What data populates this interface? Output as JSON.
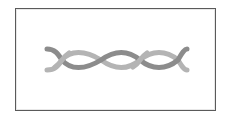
{
  "image": {
    "description": "Twisted rope / double helix icon inside a bordered frame",
    "icon": "twisted-rope-icon"
  },
  "colors": {
    "frame_border": "#5a5a5a",
    "background": "#ffffff",
    "strand_dark": "#8c8c8c",
    "strand_light": "#b4b4b4"
  }
}
